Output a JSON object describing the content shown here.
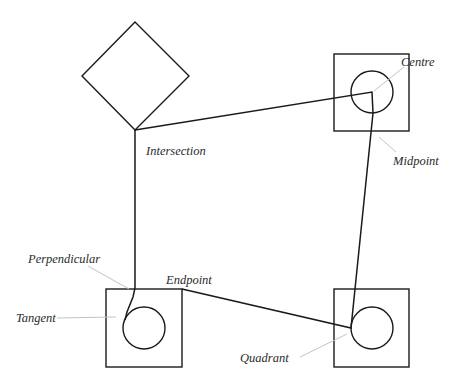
{
  "diagram": {
    "type": "object-snap-illustration",
    "labels": {
      "centre": "Centre",
      "midpoint": "Midpoint",
      "intersection": "Intersection",
      "perpendicular": "Perpendicular",
      "endpoint": "Endpoint",
      "tangent": "Tangent",
      "quadrant": "Quadrant"
    },
    "shapes": [
      {
        "kind": "diamond",
        "name": "Diamond"
      },
      {
        "kind": "square-with-circle",
        "name": "Top-right square"
      },
      {
        "kind": "square-with-circle",
        "name": "Bottom-left square"
      },
      {
        "kind": "square-with-circle",
        "name": "Bottom-right square"
      }
    ],
    "colors": {
      "line": "#1a1a1a",
      "leader": "#c4c4c4",
      "text": "#2a2a2a",
      "background": "#ffffff"
    }
  }
}
